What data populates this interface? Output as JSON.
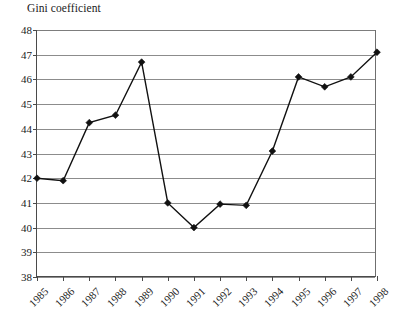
{
  "chart_data": {
    "type": "line",
    "title": "Gini coefficient",
    "xlabel": "",
    "ylabel": "",
    "ylim": [
      38,
      48
    ],
    "yticks": [
      38,
      39,
      40,
      41,
      42,
      43,
      44,
      45,
      46,
      47,
      48
    ],
    "grid": true,
    "legend": null,
    "marker": "filled-diamond",
    "categories": [
      "1985",
      "1986",
      "1987",
      "1988",
      "1989",
      "1990",
      "1991",
      "1992",
      "1993",
      "1994",
      "1995",
      "1996",
      "1997",
      "1998"
    ],
    "x": [
      1985,
      1986,
      1987,
      1988,
      1989,
      1990,
      1991,
      1992,
      1993,
      1994,
      1995,
      1996,
      1997,
      1998
    ],
    "values": [
      42.0,
      41.9,
      44.25,
      44.55,
      46.7,
      41.0,
      40.0,
      40.95,
      40.9,
      43.1,
      46.1,
      45.7,
      46.1,
      47.1
    ],
    "series": [
      {
        "name": "Gini coefficient",
        "values": [
          42.0,
          41.9,
          44.25,
          44.55,
          46.7,
          41.0,
          40.0,
          40.95,
          40.9,
          43.1,
          46.1,
          45.7,
          46.1,
          47.1
        ]
      }
    ]
  },
  "axis": {
    "y_tick_labels": [
      "48",
      "47",
      "46",
      "45",
      "44",
      "43",
      "42",
      "41",
      "40",
      "39",
      "38"
    ],
    "x_tick_labels": [
      "1985",
      "1986",
      "1987",
      "1988",
      "1989",
      "1990",
      "1991",
      "1992",
      "1993",
      "1994",
      "1995",
      "1996",
      "1997",
      "1998"
    ]
  },
  "colors": {
    "line": "#111111",
    "marker": "#111111",
    "grid": "#8c8c8c",
    "axis": "#4a4a4a",
    "text": "#1a1a1a",
    "background": "#ffffff"
  },
  "caption_sliver": ""
}
